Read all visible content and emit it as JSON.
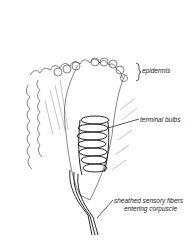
{
  "figure": {
    "labels": {
      "epidermis": "epidermis",
      "terminal_bulbs": "terminal bulbs",
      "fibers_line1": "sheathed sensory fibers",
      "fibers_line2": "entering corpuscle"
    }
  }
}
